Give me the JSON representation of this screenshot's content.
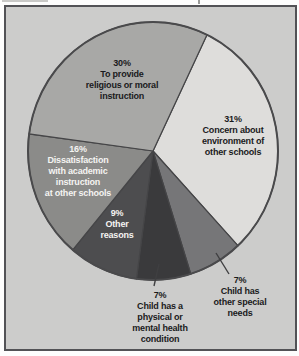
{
  "page": {
    "background": "#fdfdfd",
    "frame": {
      "bg": "#cccccb",
      "border_color": "#525256"
    }
  },
  "chart_data": {
    "type": "pie",
    "title": "",
    "legend": "none",
    "start_angle_deg": 25.6,
    "center": {
      "x": 153,
      "y": 151
    },
    "radius": {
      "rx": 125,
      "ry": 129
    },
    "stroke": "#454547",
    "rim_stroke": "#4a4a4c",
    "leader_color": "#3f3f41",
    "slices": [
      {
        "name": "concern-environment",
        "pct": 31,
        "color": "#dedddb",
        "label_lines": [
          "31%",
          "Concern about",
          "environment of",
          "other schools"
        ],
        "label_color": "#1a1a1c",
        "label_x": 233,
        "label_y": 114,
        "label_inside": true
      },
      {
        "name": "other-special-needs",
        "pct": 7,
        "color": "#767678",
        "label_lines": [
          "7%",
          "Child has",
          "other special",
          "needs"
        ],
        "label_color": "#1a1a1c",
        "label_x": 240,
        "label_y": 275,
        "label_inside": false,
        "leader": {
          "x1": 216,
          "y1": 253,
          "x2": 229,
          "y2": 274
        }
      },
      {
        "name": "physical-mental-health",
        "pct": 7,
        "color": "#3a3a3c",
        "label_lines": [
          "7%",
          "Child has a",
          "physical or",
          "mental health",
          "condition"
        ],
        "label_color": "#1a1a1c",
        "label_x": 160,
        "label_y": 290,
        "label_inside": false,
        "leader": {
          "x1": 159,
          "y1": 264,
          "x2": 154,
          "y2": 286
        }
      },
      {
        "name": "other-reasons",
        "pct": 9,
        "color": "#4d4d4f",
        "label_lines": [
          "9%",
          "Other",
          "reasons"
        ],
        "label_color": "#f5f4f2",
        "label_x": 117,
        "label_y": 208,
        "label_inside": true
      },
      {
        "name": "dissatisfaction-academic",
        "pct": 16,
        "color": "#8b8b89",
        "label_lines": [
          "16%",
          "Dissatisfaction",
          "with academic",
          "instruction",
          "at other schools"
        ],
        "label_color": "#f5f4f2",
        "label_x": 78,
        "label_y": 144,
        "label_inside": true
      },
      {
        "name": "religious-moral",
        "pct": 30,
        "color": "#a8a8a6",
        "label_lines": [
          "30%",
          "To provide",
          "religious or moral",
          "instruction"
        ],
        "label_color": "#1a1a1c",
        "label_x": 122,
        "label_y": 58,
        "label_inside": true
      }
    ]
  }
}
